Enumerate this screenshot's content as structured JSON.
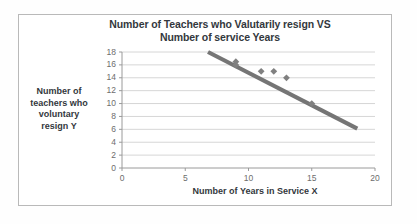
{
  "chart_data": {
    "type": "scatter",
    "title": "Number of Teachers who Valutarily resign VS Number of service Years",
    "title_line1": "Number of Teachers who Valutarily resign VS",
    "title_line2": "Number of service Years",
    "xlabel": "Number of Years in Service X",
    "ylabel": "Number of teachers who voluntary resign Y",
    "ylabel_lines": [
      "Number of",
      "teachers who",
      "voluntary",
      "resign Y"
    ],
    "xlim": [
      0,
      20
    ],
    "ylim": [
      0,
      18
    ],
    "xticks": [
      0,
      5,
      10,
      15,
      20
    ],
    "yticks": [
      0,
      2,
      4,
      6,
      8,
      10,
      12,
      14,
      16,
      18
    ],
    "grid": "horizontal",
    "legend": "none",
    "marker": "diamond",
    "marker_color": "#808080",
    "trendline_color": "#757575",
    "points": [
      {
        "x": 9,
        "y": 16
      },
      {
        "x": 9,
        "y": 16.5
      },
      {
        "x": 11,
        "y": 15
      },
      {
        "x": 12,
        "y": 15
      },
      {
        "x": 13,
        "y": 14
      },
      {
        "x": 15,
        "y": 10
      }
    ],
    "trendline": {
      "x0": 6.8,
      "y0": 18.0,
      "x1": 18.6,
      "y1": 6.1
    }
  },
  "colors": {
    "title_text": "#33383d",
    "tick_text": "#6d6d6d",
    "gridline": "#d6d6d6",
    "axis": "#9a9a9a",
    "border": "#b9b9b9",
    "background": "#ffffff"
  }
}
